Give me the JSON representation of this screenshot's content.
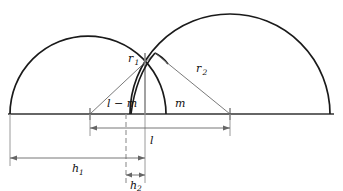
{
  "figure": {
    "type": "geometry-diagram",
    "colors": {
      "arc_stroke": "#1a1a1a",
      "thin_line": "#555555",
      "baseline": "#333333",
      "dimension_line": "#666666",
      "text": "#111111",
      "background": "#ffffff"
    },
    "geometry": {
      "baseline_y": 114,
      "left_arc": {
        "center_x": 88,
        "radius": 78,
        "start_x": 10,
        "end_x": 166,
        "apex_y": 36
      },
      "right_arc": {
        "center_x": 230,
        "radius": 100,
        "start_x": 130,
        "end_x": 330,
        "apex_y": 14
      },
      "intersection": {
        "x": 155,
        "y": 53
      },
      "tick_left_center_x": 90,
      "tick_right_center_x": 230,
      "dashed_vertical_x": 126,
      "solid_vertical_x": 145
    },
    "labels": {
      "r1": {
        "base": "r",
        "sub": "1",
        "x": 128,
        "y": 62
      },
      "r2": {
        "base": "r",
        "sub": "2",
        "x": 196,
        "y": 72
      },
      "l_minus_m": {
        "text": "l − m",
        "x": 107,
        "y": 107
      },
      "m": {
        "text": "m",
        "x": 175,
        "y": 107
      },
      "l": {
        "text": "l",
        "x": 150,
        "y": 144
      },
      "h1": {
        "base": "h",
        "sub": "1",
        "x": 72,
        "y": 172
      },
      "h2": {
        "base": "h",
        "sub": "2",
        "x": 130,
        "y": 189
      }
    },
    "dimensions": [
      {
        "name": "l",
        "from_x": 90,
        "to_x": 230,
        "y": 128,
        "label": "l"
      },
      {
        "name": "h1",
        "from_x": 10,
        "to_x": 145,
        "y": 158,
        "label": "h1"
      },
      {
        "name": "h2",
        "from_x": 126,
        "to_x": 145,
        "y": 175,
        "label": "h2"
      }
    ]
  }
}
